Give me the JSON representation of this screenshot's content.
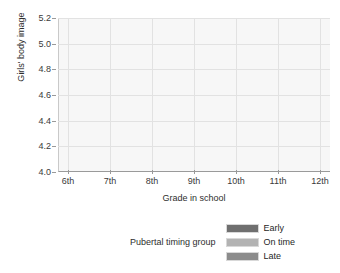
{
  "chart_data": {
    "type": "line",
    "title": "",
    "xlabel": "Grade in school",
    "ylabel": "Girls' body image",
    "categories": [
      "6th",
      "7th",
      "8th",
      "9th",
      "10th",
      "11th",
      "12th"
    ],
    "ylim": [
      4.0,
      5.2
    ],
    "yticks": [
      "4.0",
      "4.2",
      "4.4",
      "4.6",
      "4.8",
      "5.0",
      "5.2"
    ],
    "ytick_values": [
      4.0,
      4.2,
      4.4,
      4.6,
      4.8,
      5.0,
      5.2
    ],
    "grid": true,
    "legend_position": "bottom-right",
    "legend_title": "Pubertal timing group",
    "series": [
      {
        "name": "Early",
        "color": "#6f6f6f",
        "values": [
          4.61,
          4.57,
          4.17,
          4.16,
          4.15,
          4.13,
          4.11
        ]
      },
      {
        "name": "On time",
        "color": "#b3b3b3",
        "values": [
          4.29,
          4.3,
          4.39,
          4.51,
          4.63,
          4.74,
          4.86
        ]
      },
      {
        "name": "Late",
        "color": "#8c8c8c",
        "values": [
          4.48,
          4.42,
          4.25,
          4.34,
          4.43,
          4.52,
          4.61
        ]
      }
    ]
  },
  "axes": {
    "x_label": "Grade in school",
    "y_label": "Girls' body image"
  },
  "legend": {
    "title": "Pubertal timing group",
    "items": [
      {
        "label": "Early",
        "color": "#6f6f6f"
      },
      {
        "label": "On time",
        "color": "#b3b3b3"
      },
      {
        "label": "Late",
        "color": "#8c8c8c"
      }
    ]
  }
}
